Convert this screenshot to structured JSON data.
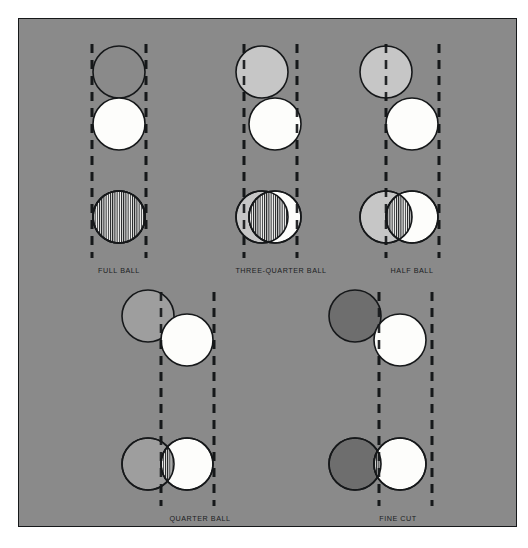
{
  "figure": {
    "plate_color": "#8a8a8a",
    "border_color": "#16181a",
    "background_color": "#ffffff"
  },
  "colors": {
    "background_gray": "#8a8a8a",
    "object_ball_full": "#8a8a8a",
    "object_ball_light": "#c6c6c6",
    "object_ball_dark": "#6e6e6e",
    "cue_ball_white": "#fdfdfb",
    "outline": "#16181a",
    "hatch_line": "#16181a",
    "dash_line": "#16181a",
    "label_text": "#1b1d1f"
  },
  "geometry": {
    "ball_radius": 26,
    "outline_width": 1.6,
    "dash_width": 2.6,
    "dash_pattern": "9 7",
    "hatch_spacing": 2.2
  },
  "panels": [
    {
      "id": "full-ball",
      "label": "FULL BALL",
      "label_x": 119,
      "label_y": 266,
      "fraction": "1",
      "overlap_description": "complete overlap - entire ball hatched",
      "object_ball_fill": "#8a8a8a",
      "top": {
        "object_ball": {
          "cx": 119,
          "cy": 72
        },
        "cue_ball": {
          "cx": 119,
          "cy": 124
        }
      },
      "bottom": {
        "object_ball": {
          "cx": 119,
          "cy": 217
        },
        "cue_ball": {
          "cx": 119,
          "cy": 217
        }
      },
      "dash_lines": [
        {
          "x": 92,
          "y1": 44,
          "y2": 258
        },
        {
          "x": 146,
          "y1": 44,
          "y2": 258
        }
      ]
    },
    {
      "id": "three-quarter-ball",
      "label": "THREE-QUARTER BALL",
      "label_x": 281,
      "label_y": 266,
      "fraction": "3/4",
      "overlap_description": "three quarters overlap",
      "object_ball_fill": "#c6c6c6",
      "top": {
        "object_ball": {
          "cx": 262,
          "cy": 72
        },
        "cue_ball": {
          "cx": 275,
          "cy": 124
        }
      },
      "bottom": {
        "object_ball": {
          "cx": 262,
          "cy": 217
        },
        "cue_ball": {
          "cx": 275,
          "cy": 217
        }
      },
      "dash_lines": [
        {
          "x": 244,
          "y1": 44,
          "y2": 258
        },
        {
          "x": 297,
          "y1": 44,
          "y2": 258
        }
      ]
    },
    {
      "id": "half-ball",
      "label": "HALF BALL",
      "label_x": 412,
      "label_y": 266,
      "fraction": "1/2",
      "overlap_description": "half overlap",
      "object_ball_fill": "#c6c6c6",
      "top": {
        "object_ball": {
          "cx": 386,
          "cy": 72
        },
        "cue_ball": {
          "cx": 412,
          "cy": 124
        }
      },
      "bottom": {
        "object_ball": {
          "cx": 386,
          "cy": 217
        },
        "cue_ball": {
          "cx": 412,
          "cy": 217
        }
      },
      "dash_lines": [
        {
          "x": 386,
          "y1": 44,
          "y2": 258
        },
        {
          "x": 439,
          "y1": 44,
          "y2": 258
        }
      ]
    },
    {
      "id": "quarter-ball",
      "label": "QUARTER BALL",
      "label_x": 200,
      "label_y": 514,
      "fraction": "1/4",
      "overlap_description": "quarter overlap",
      "object_ball_fill": "#9e9e9e",
      "top": {
        "object_ball": {
          "cx": 148,
          "cy": 316
        },
        "cue_ball": {
          "cx": 187,
          "cy": 340
        }
      },
      "bottom": {
        "object_ball": {
          "cx": 148,
          "cy": 464
        },
        "cue_ball": {
          "cx": 187,
          "cy": 464
        }
      },
      "dash_lines": [
        {
          "x": 161,
          "y1": 292,
          "y2": 506
        },
        {
          "x": 214,
          "y1": 292,
          "y2": 506
        }
      ]
    },
    {
      "id": "fine-cut",
      "label": "FINE CUT",
      "label_x": 398,
      "label_y": 514,
      "fraction": "thin",
      "overlap_description": "very thin edge contact",
      "object_ball_fill": "#6e6e6e",
      "top": {
        "object_ball": {
          "cx": 355,
          "cy": 316
        },
        "cue_ball": {
          "cx": 400,
          "cy": 340
        }
      },
      "bottom": {
        "object_ball": {
          "cx": 355,
          "cy": 464
        },
        "cue_ball": {
          "cx": 400,
          "cy": 464
        }
      },
      "dash_lines": [
        {
          "x": 379,
          "y1": 292,
          "y2": 506
        },
        {
          "x": 432,
          "y1": 292,
          "y2": 506
        }
      ]
    }
  ]
}
